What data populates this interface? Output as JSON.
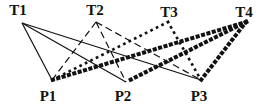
{
  "diagram": {
    "top_nodes": [
      {
        "id": "T1",
        "label": "T1",
        "label_x": 18,
        "label_y": 3,
        "anchor": [
          22,
          23
        ]
      },
      {
        "id": "T2",
        "label": "T2",
        "label_x": 95,
        "label_y": 3,
        "anchor": [
          96,
          22
        ]
      },
      {
        "id": "T3",
        "label": "T3",
        "label_x": 169,
        "label_y": 5,
        "anchor": [
          168,
          22
        ]
      },
      {
        "id": "T4",
        "label": "T4",
        "label_x": 244,
        "label_y": 5,
        "anchor": [
          246,
          22
        ]
      }
    ],
    "bottom_nodes": [
      {
        "id": "P1",
        "label": "P1",
        "label_x": 48,
        "label_y": 89,
        "anchor": [
          52,
          80
        ]
      },
      {
        "id": "P2",
        "label": "P2",
        "label_x": 123,
        "label_y": 89,
        "anchor": [
          126,
          82
        ]
      },
      {
        "id": "P3",
        "label": "P3",
        "label_x": 199,
        "label_y": 89,
        "anchor": [
          201,
          80
        ]
      }
    ],
    "line_styles": {
      "T1": {
        "stroke": "#111111",
        "width": 1.2,
        "dash": ""
      },
      "T2": {
        "stroke": "#111111",
        "width": 1.2,
        "dash": "7 4"
      },
      "T3": {
        "stroke": "#111111",
        "width": 2.6,
        "dash": "0.1 6"
      },
      "T4": {
        "stroke": "#111111",
        "width": 4.0,
        "dash": "0.1 5.5"
      }
    },
    "edges": [
      {
        "from": "T1",
        "to": "P1"
      },
      {
        "from": "T1",
        "to": "P2"
      },
      {
        "from": "T1",
        "to": "P3"
      },
      {
        "from": "T2",
        "to": "P1"
      },
      {
        "from": "T2",
        "to": "P2"
      },
      {
        "from": "T2",
        "to": "P3"
      },
      {
        "from": "T3",
        "to": "P1"
      },
      {
        "from": "T3",
        "to": "P3"
      },
      {
        "from": "T4",
        "to": "P1"
      },
      {
        "from": "T4",
        "to": "P2"
      },
      {
        "from": "T4",
        "to": "P3"
      }
    ]
  }
}
